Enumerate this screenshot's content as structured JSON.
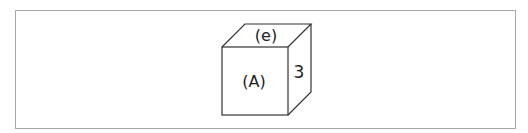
{
  "diagram": {
    "type": "cube",
    "labels": {
      "top_face": "(e)",
      "front_face": "(A)",
      "right_face": "3"
    },
    "colors": {
      "stroke": "#333333",
      "frame_border": "#a8a8a8",
      "background": "#ffffff"
    }
  }
}
